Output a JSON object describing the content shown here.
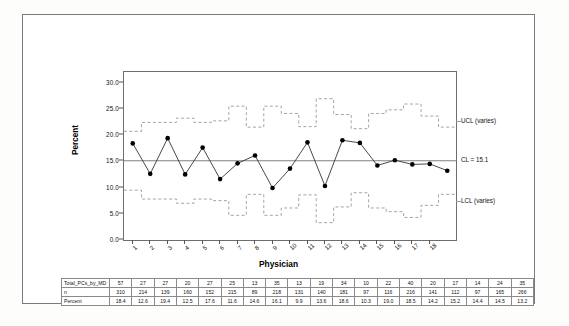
{
  "chart_data": {
    "type": "line",
    "title": "",
    "xlabel": "Physician",
    "ylabel": "Percent",
    "ylim": [
      0.0,
      32.0
    ],
    "yticks": [
      "0.0",
      "5.0",
      "10.0",
      "15.0",
      "20.0",
      "25.0",
      "30.0"
    ],
    "ytick_values": [
      0.0,
      5.0,
      10.0,
      15.0,
      20.0,
      25.0,
      30.0
    ],
    "grid": false,
    "legend_position": "right-inline",
    "categories": [
      "1",
      "2",
      "3",
      "4",
      "5",
      "6",
      "7",
      "8",
      "9",
      "10",
      "11",
      "12",
      "13",
      "14",
      "15",
      "16",
      "17",
      "18",
      "19"
    ],
    "series": [
      {
        "name": "Percent",
        "marker": "filled-circle",
        "values": [
          18.4,
          12.6,
          19.4,
          12.5,
          17.6,
          11.6,
          14.6,
          16.1,
          9.9,
          13.6,
          18.6,
          10.3,
          19.0,
          18.5,
          14.2,
          15.2,
          14.4,
          14.5,
          13.2
        ]
      },
      {
        "name": "UCL (varies)",
        "style": "dashed-step",
        "values": [
          20.7,
          22.4,
          22.4,
          23.2,
          22.4,
          22.7,
          25.5,
          21.5,
          25.5,
          24.1,
          21.6,
          26.9,
          23.9,
          21.2,
          24.1,
          24.8,
          25.9,
          23.6,
          21.5
        ]
      },
      {
        "name": "CL",
        "style": "solid",
        "value": 15.1
      },
      {
        "name": "LCL (varies)",
        "style": "dashed-step",
        "values": [
          9.5,
          7.8,
          7.8,
          7.0,
          7.8,
          7.5,
          4.7,
          8.7,
          4.7,
          6.1,
          8.6,
          3.3,
          6.3,
          9.0,
          6.1,
          5.4,
          4.3,
          6.6,
          8.7
        ]
      }
    ],
    "annotations": [
      {
        "text": "UCL (varies)",
        "y": 22.5
      },
      {
        "text": "CL = 15.1",
        "y": 15.1
      },
      {
        "text": "LCL (varies)",
        "y": 7.3
      }
    ],
    "center_line": 15.1,
    "table": {
      "row_labels": [
        "Total_PCs_by_MD",
        "n",
        "Percent"
      ],
      "rows": [
        [
          "57",
          "27",
          "27",
          "20",
          "27",
          "25",
          "13",
          "35",
          "13",
          "19",
          "34",
          "10",
          "22",
          "40",
          "20",
          "17",
          "14",
          "24",
          "35"
        ],
        [
          "310",
          "214",
          "139",
          "160",
          "152",
          "215",
          "89",
          "218",
          "131",
          "140",
          "181",
          "97",
          "116",
          "216",
          "141",
          "112",
          "97",
          "165",
          "266"
        ],
        [
          "18.4",
          "12.6",
          "19.4",
          "12.5",
          "17.6",
          "11.6",
          "14.6",
          "16.1",
          "9.9",
          "13.6",
          "18.6",
          "10.3",
          "19.0",
          "18.5",
          "14.2",
          "15.2",
          "14.4",
          "14.5",
          "13.2"
        ]
      ]
    }
  },
  "annotations": {
    "ucl": "UCL (varies)",
    "cl": "CL = 15.1",
    "lcl": "LCL (varies)"
  },
  "axes": {
    "y_title": "Percent",
    "x_title": "Physician"
  },
  "colors": {
    "line": "#333333",
    "marker": "#000000",
    "center_line": "#808080",
    "limits": "#9a9a9a",
    "frame": "#6e6e6e",
    "page_frame": "#7a7a7a",
    "text": "#111111"
  }
}
